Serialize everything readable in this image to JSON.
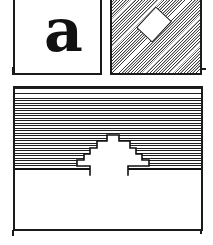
{
  "figure": {
    "panel_label": "a",
    "colors": {
      "ink": "#1a1a1a",
      "paper": "#ffffff"
    },
    "shapes": {
      "hatched_square": "diagonal-hatched-square",
      "rotated_square": "white-rotated-square",
      "main_block": "horizontal-hatched-block",
      "notch": "stepped-notch"
    }
  }
}
